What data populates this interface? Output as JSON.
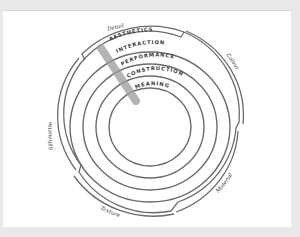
{
  "diagram": {
    "type": "concentric-layers",
    "center": {
      "x": 150,
      "y": 127
    },
    "rings": [
      {
        "id": "aesthetics",
        "label": "AESTHETICS"
      },
      {
        "id": "interaction",
        "label": "INTERACTION"
      },
      {
        "id": "performance",
        "label": "PERFORMANCE"
      },
      {
        "id": "construction",
        "label": "CONSTRUCTION"
      },
      {
        "id": "meaning",
        "label": "MEANING"
      }
    ],
    "outer_labels": {
      "detail": "Detail",
      "colour": "Colour",
      "material": "Material",
      "texture": "Texture",
      "silhouette": "Silhouette"
    },
    "colors": {
      "page_background": "#e9e9e9",
      "card_background": "#ffffff",
      "stroke": "#6b6b6b",
      "bar": "#9c9c9c",
      "text": "#3a3a3a"
    }
  }
}
